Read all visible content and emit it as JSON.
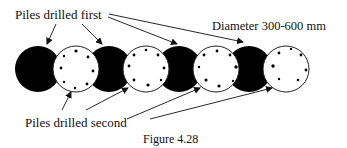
{
  "labels": {
    "first": "Piles drilled first",
    "second": "Piles drilled second",
    "diameter": "Diameter 300-600 mm",
    "caption": "Figure 4.28"
  },
  "colors": {
    "primary_pile": "#000000",
    "secondary_pile": "#ffffff",
    "stroke": "#222222"
  },
  "piles": {
    "first": [
      {
        "cx": 38,
        "cy": 69,
        "r": 23
      },
      {
        "cx": 109,
        "cy": 69,
        "r": 23
      },
      {
        "cx": 179,
        "cy": 69,
        "r": 23
      },
      {
        "cx": 249,
        "cy": 69,
        "r": 23
      }
    ],
    "second": [
      {
        "cx": 76,
        "cy": 69,
        "r": 23
      },
      {
        "cx": 146,
        "cy": 69,
        "r": 23
      },
      {
        "cx": 216,
        "cy": 69,
        "r": 23
      },
      {
        "cx": 286,
        "cy": 69,
        "r": 23
      }
    ]
  }
}
